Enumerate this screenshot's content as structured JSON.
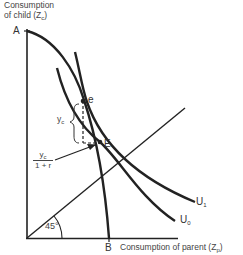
{
  "diagram": {
    "y_axis_label_line1": "Consumption",
    "y_axis_label_line2": "of child (Z",
    "y_axis_label_sub": "c",
    "y_axis_label_close": ")",
    "x_axis_label": "Consumption of parent (Z",
    "x_axis_label_sub": "p",
    "x_axis_label_close": ")",
    "point_A": "A",
    "point_B": "B",
    "point_e": "e",
    "point_E": "E",
    "curve_U1": "U",
    "curve_U1_sub": "1",
    "curve_U0": "U",
    "curve_U0_sub": "0",
    "brace_label": "y",
    "brace_label_sub": "c",
    "fraction_num": "y",
    "fraction_num_sub": "c",
    "fraction_den": "1 + r",
    "angle_label": "45°",
    "colors": {
      "line": "#222222",
      "text": "#444444"
    }
  }
}
